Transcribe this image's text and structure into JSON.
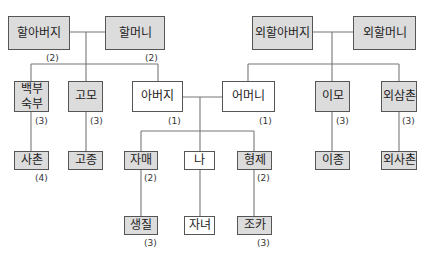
{
  "diagram": {
    "type": "family-tree",
    "nodes": {
      "grandfather": {
        "label": "할아버지",
        "degree": "(2)"
      },
      "grandmother": {
        "label": "할머니",
        "degree": "(2)"
      },
      "maternal_grandfather": {
        "label": "외할아버지"
      },
      "maternal_grandmother": {
        "label": "외할머니"
      },
      "paternal_uncle": {
        "label": "백부\n숙부",
        "degree": "(3)"
      },
      "paternal_aunt": {
        "label": "고모",
        "degree": "(3)"
      },
      "father": {
        "label": "아버지",
        "degree": "(1)"
      },
      "mother": {
        "label": "어머니",
        "degree": "(1)"
      },
      "maternal_aunt": {
        "label": "이모",
        "degree": "(3)"
      },
      "maternal_uncle": {
        "label": "외삼촌",
        "degree": "(3)"
      },
      "paternal_cousin": {
        "label": "사촌",
        "degree": "(4)"
      },
      "paternal_aunt_child": {
        "label": "고종"
      },
      "sister": {
        "label": "자매",
        "degree": "(2)"
      },
      "self": {
        "label": "나"
      },
      "brother": {
        "label": "형제",
        "degree": "(2)"
      },
      "maternal_aunt_child": {
        "label": "이종"
      },
      "maternal_cousin": {
        "label": "외사촌"
      },
      "sister_child": {
        "label": "생질",
        "degree": "(3)"
      },
      "children": {
        "label": "자녀"
      },
      "nephew": {
        "label": "조카",
        "degree": "(3)"
      }
    },
    "colors": {
      "highlight_fill": "#dcdcdc",
      "plain_fill": "#ffffff",
      "border": "#555555",
      "line": "#777777"
    }
  }
}
